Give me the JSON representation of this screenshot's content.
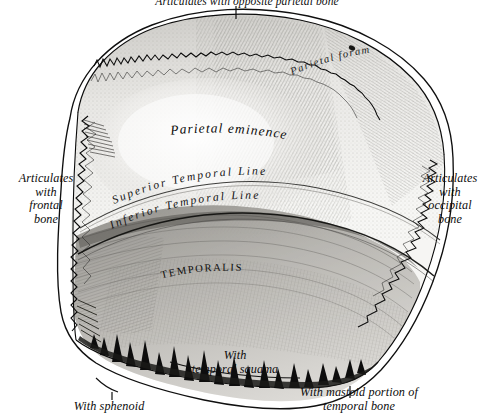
{
  "figure": {
    "ink_color": "#101010",
    "paper_color": "#ffffff",
    "bone_tone": "#d6d4d0"
  },
  "labels": {
    "top": "Articulates with opposite parietal bone",
    "left": "Articulates\nwith\nfrontal\nbone",
    "right": "Articulates\nwith\noccipital\nbone",
    "parietal_foramen": "Parietal foramen",
    "parietal_eminence": "Parietal eminence",
    "superior_temporal_line": "Superior Temporal Line",
    "inferior_temporal_line": "Inferior Temporal Line",
    "temporalis": "TEMPORALIS",
    "temporal_squama": "With\ntemporal squama",
    "sphenoid": "With sphenoid",
    "mastoid": "With mastoid portion of\ntemporal bone"
  }
}
